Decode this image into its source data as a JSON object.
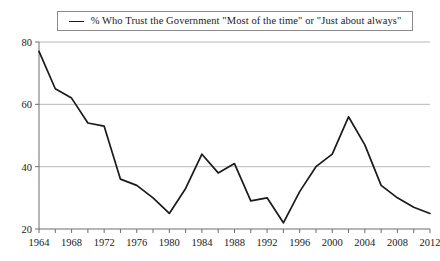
{
  "legend": {
    "marker": "line-marker-icon",
    "label": "% Who Trust the Government \"Most of the time\" or \"Just about always\""
  },
  "colors": {
    "line": "#1a1a1a",
    "grid": "#b9b9b9",
    "axis": "#6f6f6f",
    "background": "#ffffff",
    "legend_border": "#8a8a8a"
  },
  "chart_data": {
    "type": "line",
    "title": "",
    "subtitle": "",
    "xlabel": "",
    "ylabel": "",
    "xlim": [
      1964,
      2012
    ],
    "ylim": [
      20,
      80
    ],
    "grid": true,
    "grid_axis": "y",
    "legend_position": "top-center",
    "y_ticks": [
      20,
      40,
      60,
      80
    ],
    "y_tick_labels": [
      "20",
      "40",
      "60",
      "80"
    ],
    "x_ticks": [
      1964,
      1968,
      1972,
      1976,
      1980,
      1984,
      1988,
      1992,
      1996,
      2000,
      2004,
      2008,
      2012
    ],
    "x_tick_labels": [
      "1964",
      "1968",
      "1972",
      "1976",
      "1980",
      "1984",
      "1988",
      "1992",
      "1996",
      "2000",
      "2004",
      "2008",
      "2012"
    ],
    "x_minor_tick_interval": 2,
    "series": [
      {
        "name": "% Who Trust the Government \"Most of the time\" or \"Just about always\"",
        "x": [
          1964,
          1966,
          1968,
          1970,
          1972,
          1974,
          1976,
          1978,
          1980,
          1982,
          1984,
          1986,
          1988,
          1990,
          1992,
          1994,
          1996,
          1998,
          2000,
          2002,
          2004,
          2006,
          2008,
          2010,
          2012
        ],
        "values": [
          77,
          65,
          62,
          54,
          53,
          36,
          34,
          30,
          25,
          33,
          44,
          38,
          41,
          29,
          30,
          22,
          32,
          40,
          44,
          56,
          47,
          34,
          30,
          27,
          25
        ]
      }
    ]
  }
}
